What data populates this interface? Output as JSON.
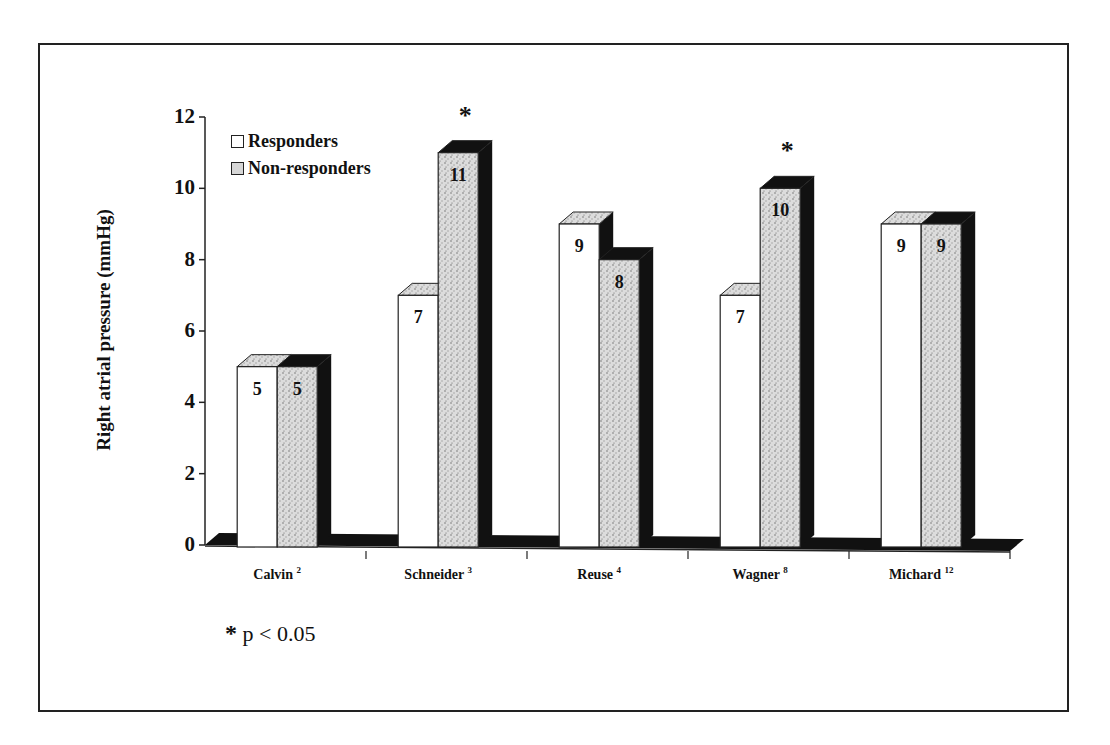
{
  "chart_data": {
    "type": "bar",
    "style": "3d-clustered",
    "title": "",
    "xlabel": "",
    "ylabel": "Right atrial pressure (mmHg)",
    "ylim": [
      0,
      12
    ],
    "yticks": [
      0,
      2,
      4,
      6,
      8,
      10,
      12
    ],
    "grid": false,
    "legend_position": "top-left inside",
    "categories": [
      "Calvin",
      "Schneider",
      "Reuse",
      "Wagner",
      "Michard"
    ],
    "category_refs": [
      "2",
      "3",
      "4",
      "8",
      "12"
    ],
    "series": [
      {
        "name": "Responders",
        "fill": "white",
        "values": [
          5,
          7,
          9,
          7,
          9
        ]
      },
      {
        "name": "Non-responders",
        "fill": "stippled grey",
        "values": [
          5,
          11,
          8,
          10,
          9
        ]
      }
    ],
    "significant_categories": [
      "Schneider",
      "Wagner"
    ],
    "annotations": [
      "* p < 0.05"
    ]
  },
  "legend": {
    "items": [
      {
        "label": "Responders"
      },
      {
        "label": "Non-responders"
      }
    ]
  },
  "footnote": {
    "star": "*",
    "text": "p < 0.05"
  },
  "significance_marker": "*",
  "colors": {
    "frame": "#222222",
    "bar_responders": "#ffffff",
    "bar_nonresponders": "#d6d6d6",
    "shadow": "#111111"
  }
}
